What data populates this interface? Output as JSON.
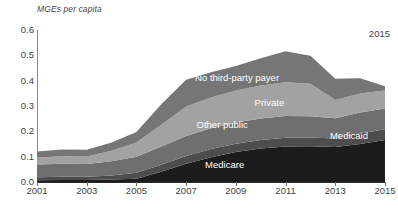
{
  "chart_data": {
    "type": "area",
    "stacked": true,
    "title": "",
    "subtitle": "",
    "xlabel": "",
    "ylabel": "MGEs per capita",
    "ylabel_style": "italic",
    "xlim": [
      2001,
      2015
    ],
    "ylim": [
      0.0,
      0.6
    ],
    "grid": false,
    "legend_position": "inline-labels",
    "y_ticks": [
      "0.0",
      "0.1",
      "0.2",
      "0.3",
      "0.4",
      "0.5",
      "0.6"
    ],
    "y_tick_values": [
      0.0,
      0.1,
      0.2,
      0.3,
      0.4,
      0.5,
      0.6
    ],
    "x_ticks": [
      "2001",
      "2003",
      "2005",
      "2007",
      "2009",
      "2011",
      "2013",
      "2015"
    ],
    "x_tick_values": [
      2001,
      2003,
      2005,
      2007,
      2009,
      2011,
      2013,
      2015
    ],
    "x": [
      2001,
      2002,
      2003,
      2004,
      2005,
      2006,
      2007,
      2008,
      2009,
      2010,
      2011,
      2012,
      2013,
      2014,
      2015
    ],
    "annotations": [
      {
        "text": "2015",
        "position": "top-right"
      }
    ],
    "series": [
      {
        "name": "Medicare",
        "color": "#1c1c1c",
        "label_x": 2008.55,
        "label_y": 0.072,
        "values": [
          0.007,
          0.008,
          0.008,
          0.01,
          0.013,
          0.04,
          0.072,
          0.098,
          0.118,
          0.132,
          0.14,
          0.141,
          0.138,
          0.15,
          0.166
        ]
      },
      {
        "name": "Medicaid",
        "color": "#4d4d4d",
        "label_x": 2013.55,
        "label_y": 0.186,
        "values": [
          0.012,
          0.013,
          0.013,
          0.016,
          0.024,
          0.028,
          0.031,
          0.032,
          0.033,
          0.034,
          0.035,
          0.035,
          0.034,
          0.041,
          0.042
        ]
      },
      {
        "name": "Other public",
        "color": "#6f6f6f",
        "label_x": 2008.45,
        "label_y": 0.228,
        "values": [
          0.05,
          0.051,
          0.05,
          0.056,
          0.063,
          0.072,
          0.079,
          0.082,
          0.084,
          0.085,
          0.086,
          0.084,
          0.08,
          0.083,
          0.082
        ]
      },
      {
        "name": "Private",
        "color": "#a2a2a2",
        "label_x": 2010.35,
        "label_y": 0.314,
        "values": [
          0.027,
          0.03,
          0.03,
          0.041,
          0.056,
          0.086,
          0.116,
          0.122,
          0.126,
          0.13,
          0.133,
          0.128,
          0.072,
          0.075,
          0.071
        ]
      },
      {
        "name": "No third-party payer",
        "color": "#767676",
        "label_x": 2009.05,
        "label_y": 0.414,
        "values": [
          0.024,
          0.026,
          0.026,
          0.033,
          0.041,
          0.081,
          0.106,
          0.099,
          0.097,
          0.107,
          0.122,
          0.11,
          0.084,
          0.061,
          0.017
        ]
      }
    ],
    "totals": [
      0.12,
      0.128,
      0.127,
      0.156,
      0.197,
      0.307,
      0.404,
      0.433,
      0.458,
      0.488,
      0.516,
      0.498,
      0.408,
      0.41,
      0.378
    ]
  }
}
